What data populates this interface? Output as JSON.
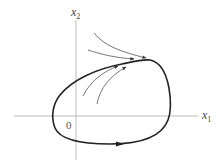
{
  "diagram": {
    "axes": {
      "x_label_base": "x",
      "x_label_sub": "1",
      "y_label_base": "x",
      "y_label_sub": "2",
      "origin_label": "0"
    },
    "elements": {
      "limit_cycle": "closed orbit (limit cycle), counter-clockwise",
      "trajectories": [
        "outer trajectory from above approaching cycle",
        "trajectory from upper-left approaching cycle",
        "inner trajectory from lower-left approaching cycle",
        "inner trajectory from below approaching cycle"
      ]
    },
    "colors": {
      "axis": "#bbbbbb",
      "cycle": "#222222",
      "trajectory": "#666666",
      "label": "#444444"
    }
  }
}
